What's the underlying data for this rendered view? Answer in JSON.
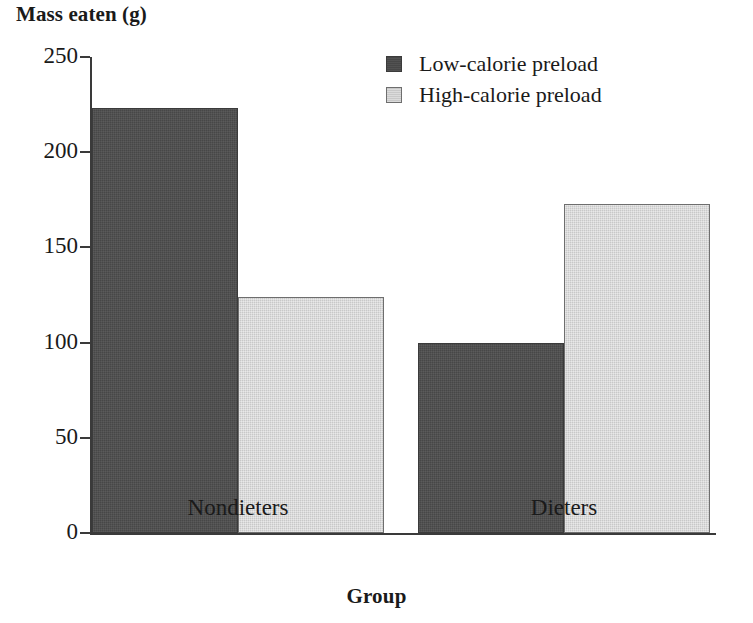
{
  "chart_data": {
    "type": "bar",
    "title": "",
    "ylabel": "Mass eaten (g)",
    "xlabel": "Group",
    "categories": [
      "Nondieters",
      "Dieters"
    ],
    "series": [
      {
        "name": "Low-calorie preload",
        "color": "#474747",
        "values": [
          223,
          100
        ]
      },
      {
        "name": "High-calorie preload",
        "color": "#c8c8c8",
        "values": [
          124,
          173
        ]
      }
    ],
    "ylim": [
      0,
      250
    ],
    "ytick_labels": [
      "0",
      "50",
      "100",
      "150",
      "200",
      "250"
    ],
    "ytick_values": [
      0,
      50,
      100,
      150,
      200,
      250
    ],
    "grid": false,
    "legend_position": "top-right",
    "bar_grouping": "adjacent-pairs"
  },
  "legend": {
    "entries": [
      {
        "label": "Low-calorie preload",
        "swatch": "legend-swatch-dark"
      },
      {
        "label": "High-calorie preload",
        "swatch": "legend-swatch-light"
      }
    ]
  },
  "axes": {
    "y_title": "Mass eaten (g)",
    "x_title": "Group",
    "y_ticks": [
      {
        "label": "250",
        "value": 250
      },
      {
        "label": "200",
        "value": 200
      },
      {
        "label": "150",
        "value": 150
      },
      {
        "label": "100",
        "value": 100
      },
      {
        "label": "50",
        "value": 50
      },
      {
        "label": "0",
        "value": 0
      }
    ],
    "x_categories": [
      {
        "label": "Nondieters"
      },
      {
        "label": "Dieters"
      }
    ]
  },
  "bars": [
    {
      "group": "Nondieters",
      "series": "Low-calorie preload",
      "value": 223
    },
    {
      "group": "Nondieters",
      "series": "High-calorie preload",
      "value": 124
    },
    {
      "group": "Dieters",
      "series": "Low-calorie preload",
      "value": 100
    },
    {
      "group": "Dieters",
      "series": "High-calorie preload",
      "value": 173
    }
  ]
}
